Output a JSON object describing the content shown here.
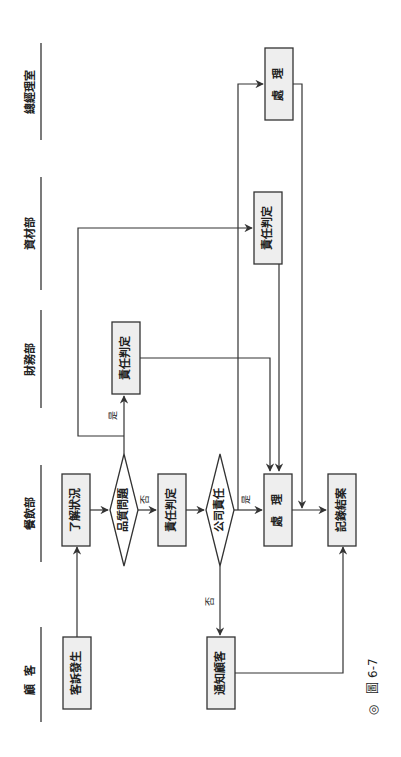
{
  "figure": {
    "caption_marker": "◎",
    "caption_label": "圖 6-7",
    "orientation": "rotated 90° counter-clockwise"
  },
  "lanes": [
    {
      "id": "gm",
      "label": "總經理室"
    },
    {
      "id": "materials",
      "label": "資材部"
    },
    {
      "id": "finance",
      "label": "財務部"
    },
    {
      "id": "fnb",
      "label": "餐飲部"
    },
    {
      "id": "customer",
      "label": "顧客"
    }
  ],
  "nodes": {
    "complaint": {
      "label": "客訴發生",
      "lane": "customer",
      "shape": "process"
    },
    "understand": {
      "label": "了解狀況",
      "lane": "fnb",
      "shape": "process"
    },
    "quality_q": {
      "label": "品質問題",
      "lane": "fnb",
      "shape": "decision"
    },
    "resp_fnb": {
      "label": "責任判定",
      "lane": "fnb",
      "shape": "process"
    },
    "company_q": {
      "label": "公司責任",
      "lane": "fnb",
      "shape": "decision"
    },
    "handle_fnb": {
      "label": "處　理",
      "lane": "fnb",
      "shape": "process"
    },
    "record_close": {
      "label": "記錄結案",
      "lane": "fnb",
      "shape": "process"
    },
    "notify_customer": {
      "label": "通知顧客",
      "lane": "customer",
      "shape": "process"
    },
    "resp_finance": {
      "label": "責任判定",
      "lane": "finance",
      "shape": "process"
    },
    "resp_materials": {
      "label": "責任判定",
      "lane": "materials",
      "shape": "process"
    },
    "handle_gm": {
      "label": "處　理",
      "lane": "gm",
      "shape": "process"
    }
  },
  "edge_labels": {
    "yes": "是",
    "no": "否"
  },
  "edges": [
    {
      "from": "complaint",
      "to": "understand"
    },
    {
      "from": "understand",
      "to": "quality_q"
    },
    {
      "from": "quality_q",
      "to": "resp_fnb",
      "label": "否"
    },
    {
      "from": "quality_q",
      "to": "resp_finance",
      "label": "是"
    },
    {
      "from": "quality_q",
      "to": "resp_materials",
      "label": "是"
    },
    {
      "from": "resp_fnb",
      "to": "company_q"
    },
    {
      "from": "company_q",
      "to": "handle_fnb",
      "label": "是"
    },
    {
      "from": "company_q",
      "to": "handle_gm",
      "label": "是"
    },
    {
      "from": "company_q",
      "to": "notify_customer",
      "label": "否"
    },
    {
      "from": "resp_finance",
      "to": "handle_fnb"
    },
    {
      "from": "resp_materials",
      "to": "handle_fnb"
    },
    {
      "from": "handle_gm",
      "to": "record_close"
    },
    {
      "from": "handle_fnb",
      "to": "record_close"
    },
    {
      "from": "notify_customer",
      "to": "record_close"
    }
  ]
}
